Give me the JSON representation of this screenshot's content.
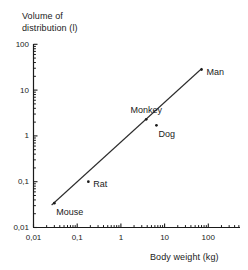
{
  "chart_data": {
    "type": "scatter",
    "title": "",
    "xlabel": "Body weight (kg)",
    "ylabel": "Volume of distribution (l)",
    "xscale": "log",
    "yscale": "log",
    "xlim": [
      0.01,
      300
    ],
    "ylim": [
      0.01,
      100
    ],
    "grid": false,
    "legend": "none",
    "decimal_separator": ",",
    "x_tick_labels": [
      "0,01",
      "0,1",
      "1",
      "10",
      "100"
    ],
    "x_tick_values": [
      0.01,
      0.1,
      1,
      10,
      100
    ],
    "y_tick_labels": [
      "0,01",
      "0,1",
      "1",
      "10",
      "100"
    ],
    "y_tick_values": [
      0.01,
      0.1,
      1,
      10,
      100
    ],
    "minor_ticks": true,
    "points": [
      {
        "label": "Mouse",
        "x": 0.03,
        "y": 0.034,
        "label_position": "below-right"
      },
      {
        "label": "Rat",
        "x": 0.18,
        "y": 0.1,
        "label_position": "right"
      },
      {
        "label": "Monkey",
        "x": 3.8,
        "y": 2.3,
        "label_position": "above"
      },
      {
        "label": "Dog",
        "x": 6.5,
        "y": 1.7,
        "label_position": "below-right"
      },
      {
        "label": "Man",
        "x": 70,
        "y": 28,
        "label_position": "right"
      }
    ],
    "fit_line": {
      "type": "allometric-regression",
      "x_start": 0.026,
      "y_start": 0.031,
      "x_end": 72,
      "y_end": 30
    },
    "colors": {
      "axis": "#1a1a1a",
      "line": "#2b2b2b",
      "marker": "#1a1a1a",
      "text": "#1a1a1a",
      "background": "#ffffff"
    }
  },
  "axes": {
    "y_title_line1": "Volume of",
    "y_title_line2": "distribution (l)",
    "x_title": "Body weight (kg)"
  }
}
